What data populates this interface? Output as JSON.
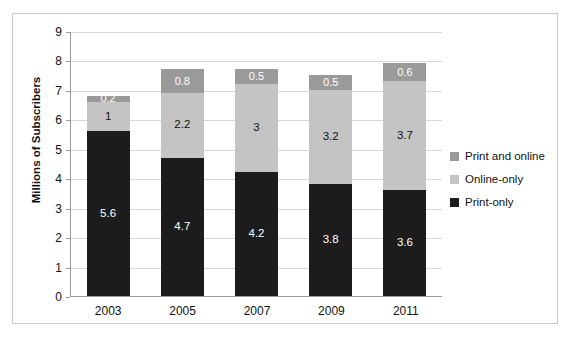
{
  "chart_data": {
    "type": "bar",
    "subtype": "stacked-bar",
    "title": "",
    "xlabel": "",
    "ylabel": "Millions of Subscribers",
    "categories": [
      "2003",
      "2005",
      "2007",
      "2009",
      "2011"
    ],
    "ylim": [
      0,
      9
    ],
    "ytick_labels": [
      "0",
      "1",
      "2",
      "3",
      "4",
      "5",
      "6",
      "7",
      "8",
      "9"
    ],
    "ytick_values": [
      0,
      1,
      2,
      3,
      4,
      5,
      6,
      7,
      8,
      9
    ],
    "grid": true,
    "legend_position": "right",
    "series": [
      {
        "name": "Print-only",
        "color": "#1c1c1c",
        "label_color": "#ffffff",
        "values": [
          5.6,
          4.7,
          4.2,
          3.8,
          3.6
        ],
        "labels": [
          "5.6",
          "4.7",
          "4.2",
          "3.8",
          "3.6"
        ]
      },
      {
        "name": "Online-only",
        "color": "#c4c4c4",
        "label_color": "#111111",
        "values": [
          1,
          2.2,
          3,
          3.2,
          3.7
        ],
        "labels": [
          "1",
          "2.2",
          "3",
          "3.2",
          "3.7"
        ]
      },
      {
        "name": "Print and online",
        "color": "#9a9a9a",
        "label_color": "#ffffff",
        "values": [
          0.2,
          0.8,
          0.5,
          0.5,
          0.6
        ],
        "labels": [
          "0.2",
          "0.8",
          "0.5",
          "0.5",
          "0.6"
        ]
      }
    ],
    "totals": [
      6.8,
      7.7,
      7.7,
      7.5,
      7.9
    ],
    "legend": [
      {
        "label": "Print and online",
        "color": "#9a9a9a"
      },
      {
        "label": "Online-only",
        "color": "#c4c4c4"
      },
      {
        "label": "Print-only",
        "color": "#1c1c1c"
      }
    ]
  }
}
